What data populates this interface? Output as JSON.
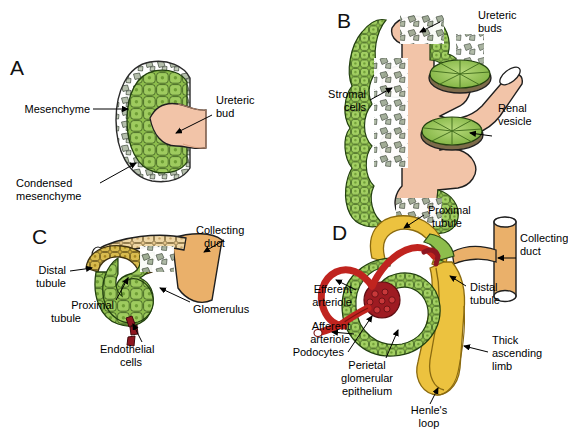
{
  "figure": {
    "background_color": "#ffffff",
    "colors": {
      "epithelial_green": "#7fb241",
      "epithelial_green_light": "#9ecb5e",
      "mesenchyme_gray": "#b9c3ae",
      "stromal_gray": "#9aa691",
      "ureteric_salmon": "#f2c4a8",
      "collecting_duct_tan": "#eab06a",
      "tubule_yellow": "#ecc23f",
      "distal_olive": "#c8a63a",
      "endothelial_dark_red": "#8e1620",
      "arteriole_red": "#c0241f",
      "vesicle_rim_brown": "#8a7a5c",
      "outline": "#1a1a1a",
      "label_text": "#000000"
    }
  },
  "panels": [
    {
      "id": "A",
      "letter": "A",
      "caption": "Ureteric bud invading condensed metanephric mesenchyme",
      "labels": [
        {
          "name": "mesenchyme",
          "text": "Mesenchyme",
          "lines": [
            "Mesenchyme"
          ]
        },
        {
          "name": "ureteric-bud",
          "text": "Ureteric bud",
          "lines": [
            "Ureteric",
            "bud"
          ]
        },
        {
          "name": "condensed-mesenchyme",
          "text": "Condensed mesenchyme",
          "lines": [
            "Condensed",
            "mesenchyme"
          ]
        }
      ]
    },
    {
      "id": "B",
      "letter": "B",
      "caption": "Branched ureteric buds with renal vesicles and stromal cells",
      "labels": [
        {
          "name": "ureteric-buds",
          "text": "Ureteric buds",
          "lines": [
            "Ureteric",
            "buds"
          ]
        },
        {
          "name": "stromal-cells",
          "text": "Stromal cells",
          "lines": [
            "Stromal",
            "cells"
          ]
        },
        {
          "name": "renal-vesicle",
          "text": "Renal vesicle",
          "lines": [
            "Renal",
            "vesicle"
          ]
        }
      ]
    },
    {
      "id": "C",
      "letter": "C",
      "caption": "S-shaped body with invading endothelial cells forming the glomerulus",
      "labels": [
        {
          "name": "collecting-duct",
          "text": "Collecting duct",
          "lines": [
            "Collecting",
            "duct"
          ]
        },
        {
          "name": "distal-tubule",
          "text": "Distal tubule",
          "lines": [
            "Distal",
            "tubule"
          ]
        },
        {
          "name": "proximal-tubule",
          "text": "Proximal tubule",
          "lines": [
            "Proximal",
            "tubule"
          ]
        },
        {
          "name": "glomerulus",
          "text": "Glomerulus",
          "lines": [
            "Glomerulus"
          ]
        },
        {
          "name": "endothelial-cells",
          "text": "Endothelial cells",
          "lines": [
            "Endothelial",
            "cells"
          ]
        }
      ]
    },
    {
      "id": "D",
      "letter": "D",
      "caption": "Mature nephron with glomerulus, tubules, loop of Henle and collecting duct",
      "labels": [
        {
          "name": "proximal-tubule",
          "text": "Proximal tubule",
          "lines": [
            "Proximal",
            "tubule"
          ]
        },
        {
          "name": "collecting-duct",
          "text": "Collecting duct",
          "lines": [
            "Collecting",
            "duct"
          ]
        },
        {
          "name": "distal-tubule",
          "text": "Distal tubule",
          "lines": [
            "Distal",
            "tubule"
          ]
        },
        {
          "name": "efferent-arteriole",
          "text": "Efferent arteriole",
          "lines": [
            "Efferent",
            "arteriole"
          ]
        },
        {
          "name": "afferent-arteriole",
          "text": "Afferent arteriole",
          "lines": [
            "Afferent",
            "arteriole"
          ]
        },
        {
          "name": "podocytes",
          "text": "Podocytes",
          "lines": [
            "Podocytes"
          ]
        },
        {
          "name": "parietal-glomerular-epithelium",
          "text": "Perietal glomerular epithelium",
          "lines": [
            "Perietal",
            "glomerular",
            "epithelium"
          ]
        },
        {
          "name": "thick-ascending-limb",
          "text": "Thick ascending limb",
          "lines": [
            "Thick",
            "ascending",
            "limb"
          ]
        },
        {
          "name": "henles-loop",
          "text": "Henle's loop",
          "lines": [
            "Henle's",
            "loop"
          ]
        }
      ]
    }
  ],
  "label_text": {
    "a_mesenchyme": "Mesenchyme",
    "a_ureteric_l1": "Ureteric",
    "a_ureteric_l2": "bud",
    "a_condensed_l1": "Condensed",
    "a_condensed_l2": "mesenchyme",
    "b_ureteric_l1": "Ureteric",
    "b_ureteric_l2": "buds",
    "b_stromal_l1": "Stromal",
    "b_stromal_l2": "cells",
    "b_vesicle_l1": "Renal",
    "b_vesicle_l2": "vesicle",
    "c_collecting_l1": "Collecting",
    "c_collecting_l2": "duct",
    "c_distal_l1": "Distal",
    "c_distal_l2": "tubule",
    "c_proximal_l1": "Proximal",
    "c_proximal_l2": "tubule",
    "c_glomerulus": "Glomerulus",
    "c_endothelial_l1": "Endothelial",
    "c_endothelial_l2": "cells",
    "d_proximal_l1": "Proximal",
    "d_proximal_l2": "tubule",
    "d_collecting_l1": "Collecting",
    "d_collecting_l2": "duct",
    "d_distal_l1": "Distal",
    "d_distal_l2": "tubule",
    "d_efferent_l1": "Efferent",
    "d_efferent_l2": "arteriole",
    "d_afferent_l1": "Afferent",
    "d_afferent_l2": "arteriole",
    "d_podocytes": "Podocytes",
    "d_perietal_l1": "Perietal",
    "d_perietal_l2": "glomerular",
    "d_perietal_l3": "epithelium",
    "d_thick_l1": "Thick",
    "d_thick_l2": "ascending",
    "d_thick_l3": "limb",
    "d_henle_l1": "Henle's",
    "d_henle_l2": "loop",
    "letter_a": "A",
    "letter_b": "B",
    "letter_c": "C",
    "letter_d": "D"
  }
}
